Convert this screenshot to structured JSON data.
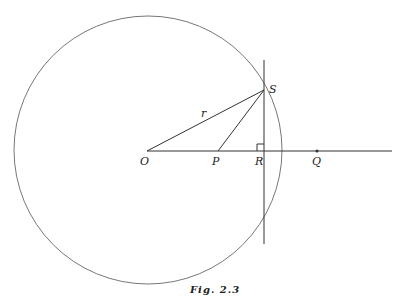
{
  "figure": {
    "caption": "Fig. 2.3",
    "points": {
      "O": {
        "label": "O",
        "x": 147,
        "y": 151
      },
      "P": {
        "label": "P",
        "x": 218,
        "y": 151
      },
      "R": {
        "label": "R",
        "x": 264,
        "y": 151
      },
      "Q": {
        "label": "Q",
        "x": 317,
        "y": 151
      },
      "S": {
        "label": "S",
        "x": 264,
        "y": 90
      }
    },
    "segment_labels": {
      "OS": "r"
    },
    "circle": {
      "center": "O",
      "cx": 148,
      "cy": 150,
      "radius": 134
    },
    "stroke_color": "#333333"
  }
}
